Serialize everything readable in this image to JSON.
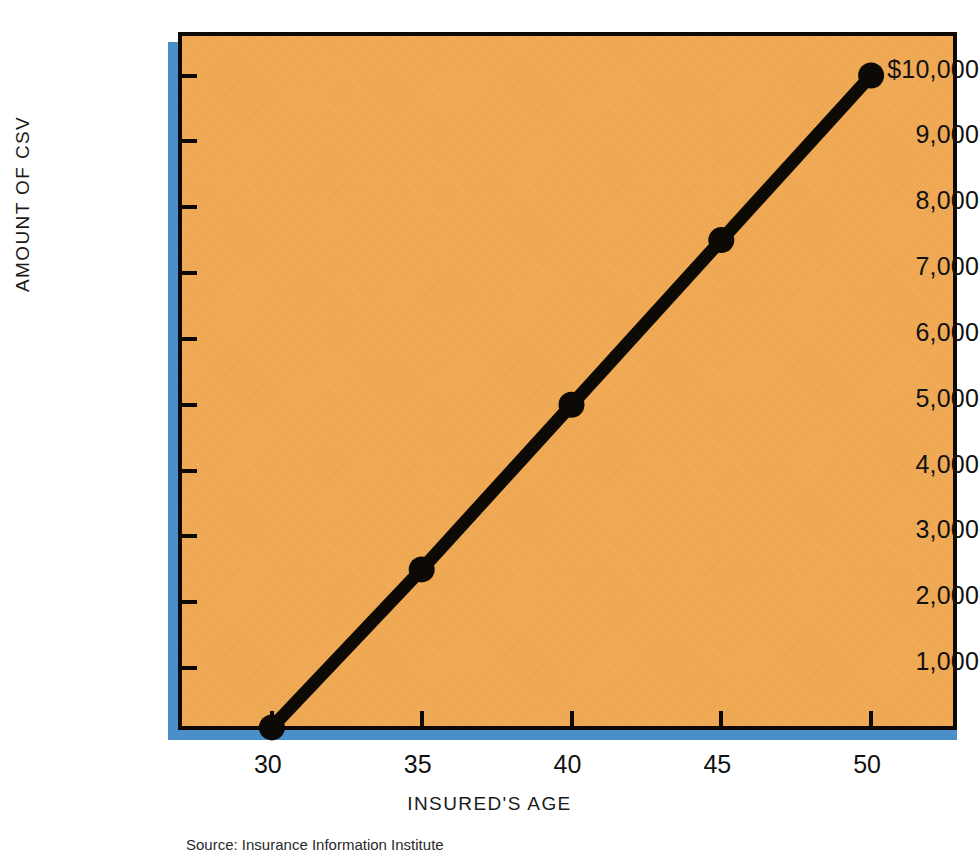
{
  "chart_data": {
    "type": "line",
    "title": "",
    "xlabel": "INSURED'S AGE",
    "ylabel": "AMOUNT OF CSV",
    "x": [
      30,
      35,
      40,
      45,
      50
    ],
    "values": [
      100,
      2500,
      5000,
      7500,
      10000
    ],
    "series": [
      {
        "name": "Cash Surrender Value",
        "values": [
          100,
          2500,
          5000,
          7500,
          10000
        ]
      }
    ],
    "xlim": [
      27,
      53
    ],
    "ylim": [
      0,
      10600
    ],
    "x_tick_labels": [
      "30",
      "35",
      "40",
      "45",
      "50"
    ],
    "y_tick_values": [
      1000,
      2000,
      3000,
      4000,
      5000,
      6000,
      7000,
      8000,
      9000,
      10000
    ],
    "y_tick_labels": [
      "1,000",
      "2,000",
      "3,000",
      "4,000",
      "5,000",
      "6,000",
      "7,000",
      "8,000",
      "9,000",
      "$10,000"
    ],
    "grid": false,
    "legend": "none",
    "marker": "circle",
    "line_color": "#0d0a06",
    "marker_color": "#0d0a06",
    "plot_background": "#f0a952",
    "shadow_color": "#4a8fc7",
    "axis_color": "#0d0a06"
  },
  "source": {
    "note": "Source: Insurance Information Institute"
  }
}
